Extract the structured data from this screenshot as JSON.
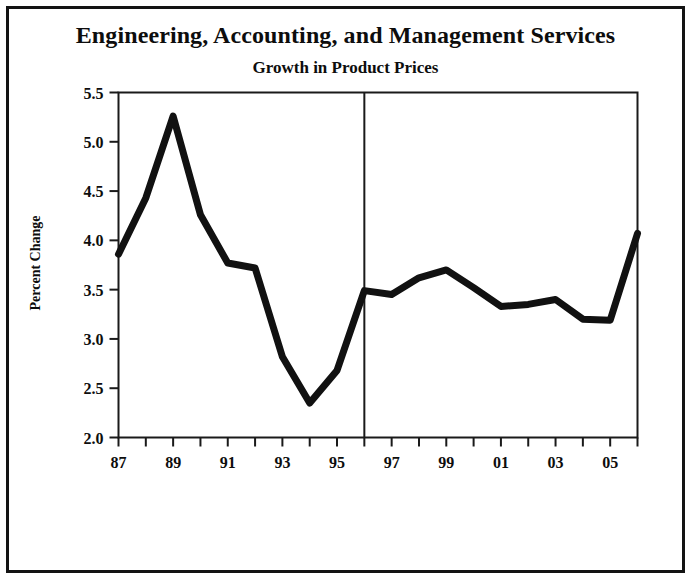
{
  "figure": {
    "main_title": "Engineering, Accounting, and Management Services",
    "sub_title": "Growth in Product Prices",
    "border_color": "#131313",
    "background_color": "#ffffff"
  },
  "chart_data": {
    "type": "line",
    "title": "Engineering, Accounting, and Management Services",
    "subtitle": "Growth in Product Prices",
    "xlabel": "",
    "ylabel": "Percent Change",
    "x": [
      1987,
      1988,
      1989,
      1990,
      1991,
      1992,
      1993,
      1994,
      1995,
      1996,
      1997,
      1998,
      1999,
      2000,
      2001,
      2002,
      2003,
      2004,
      2005,
      2006
    ],
    "values": [
      3.86,
      4.43,
      5.26,
      4.26,
      3.77,
      3.72,
      2.82,
      2.35,
      2.68,
      3.49,
      3.45,
      3.62,
      3.7,
      3.52,
      3.33,
      3.35,
      3.4,
      3.2,
      3.19,
      4.07
    ],
    "series": [
      {
        "name": "Percent Change",
        "color": "#111111",
        "values": [
          3.86,
          4.43,
          5.26,
          4.26,
          3.77,
          3.72,
          2.82,
          2.35,
          2.68,
          3.49,
          3.45,
          3.62,
          3.7,
          3.52,
          3.33,
          3.35,
          3.4,
          3.2,
          3.19,
          4.07
        ]
      }
    ],
    "ylim": [
      2.0,
      5.5
    ],
    "xlim": [
      1987,
      2006
    ],
    "ytick_values": [
      2.0,
      2.5,
      3.0,
      3.5,
      4.0,
      4.5,
      5.0,
      5.5
    ],
    "ytick_labels": [
      "2.0",
      "2.5",
      "3.0",
      "3.5",
      "4.0",
      "4.5",
      "5.0",
      "5.5"
    ],
    "xtick_values": [
      1987,
      1988,
      1989,
      1990,
      1991,
      1992,
      1993,
      1994,
      1995,
      1996,
      1997,
      1998,
      1999,
      2000,
      2001,
      2002,
      2003,
      2004,
      2005,
      2006
    ],
    "xtick_labels": [
      "87",
      "",
      "89",
      "",
      "91",
      "",
      "93",
      "",
      "95",
      "",
      "97",
      "",
      "99",
      "",
      "01",
      "",
      "03",
      "",
      "05",
      ""
    ],
    "grid": false,
    "legend": false,
    "annotations": [
      {
        "name": "forecast-divider",
        "type": "vline",
        "x": 1996,
        "color": "#1a1a1a"
      }
    ]
  }
}
